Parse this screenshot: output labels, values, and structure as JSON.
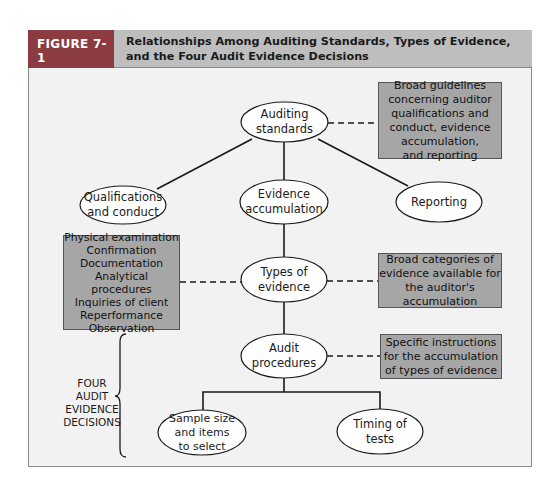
{
  "figure": {
    "label": "FIGURE 7-1",
    "title": "Relationships Among Auditing Standards, Types of Evidence, and the Four Audit Evidence Decisions",
    "colors": {
      "label_bg": "#8c3b40",
      "title_bg": "#bebebe",
      "canvas_bg": "#f2f2f2",
      "box_bg": "#a6a6a6"
    }
  },
  "nodes": {
    "auditing_standards": "Auditing\nstandards",
    "qualifications": "Qualifications\nand conduct",
    "evidence_accumulation": "Evidence\naccumulation",
    "reporting": "Reporting",
    "types_of_evidence": "Types of\nevidence",
    "audit_procedures": "Audit\nprocedures",
    "sample_size": "Sample size\nand items\nto select",
    "timing": "Timing of\ntests"
  },
  "boxes": {
    "standards_note": "Broad guidelines\nconcerning auditor\nqualifications and\nconduct, evidence\naccumulation,\nand reporting",
    "evidence_list": "Physical examination\nConfirmation\nDocumentation\nAnalytical procedures\nInquiries of client\nReperformance\nObservation",
    "types_note": "Broad categories of\nevidence available for\nthe auditor's\naccumulation",
    "procedures_note": "Specific instructions\nfor the accumulation\nof types of evidence"
  },
  "brace_label": "FOUR\nAUDIT\nEVIDENCE\nDECISIONS"
}
